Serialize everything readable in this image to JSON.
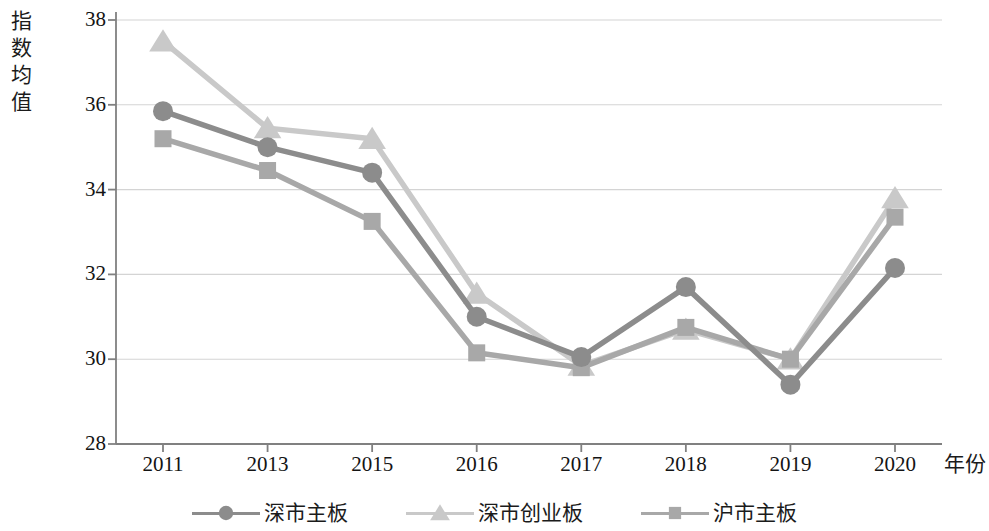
{
  "chart_data": {
    "type": "line",
    "title": "",
    "xlabel": "年份",
    "ylabel": "指数均值",
    "categories": [
      "2011",
      "2013",
      "2015",
      "2016",
      "2017",
      "2018",
      "2019",
      "2020"
    ],
    "ylim": [
      28,
      38
    ],
    "yticks": [
      28,
      30,
      32,
      34,
      36,
      38
    ],
    "grid": true,
    "legend_position": "bottom",
    "series": [
      {
        "name": "深市主板",
        "marker": "circle",
        "color": "#8c8c8c",
        "values": [
          35.85,
          35.0,
          34.4,
          31.0,
          30.05,
          31.7,
          29.4,
          32.15
        ]
      },
      {
        "name": "深市创业板",
        "marker": "triangle",
        "color": "#c9c9c9",
        "values": [
          37.5,
          35.45,
          35.2,
          31.55,
          29.85,
          30.7,
          30.0,
          33.8
        ]
      },
      {
        "name": "沪市主板",
        "marker": "square",
        "color": "#a8a8a8",
        "values": [
          35.2,
          34.45,
          33.25,
          30.15,
          29.8,
          30.75,
          30.0,
          33.35
        ]
      }
    ]
  },
  "axis": {
    "y_title": "指数均值",
    "x_title": "年份"
  },
  "colors": {
    "axis": "#808080",
    "grid": "#d4d4d4",
    "series_1": "#8c8c8c",
    "series_2": "#c9c9c9",
    "series_3": "#a8a8a8"
  }
}
